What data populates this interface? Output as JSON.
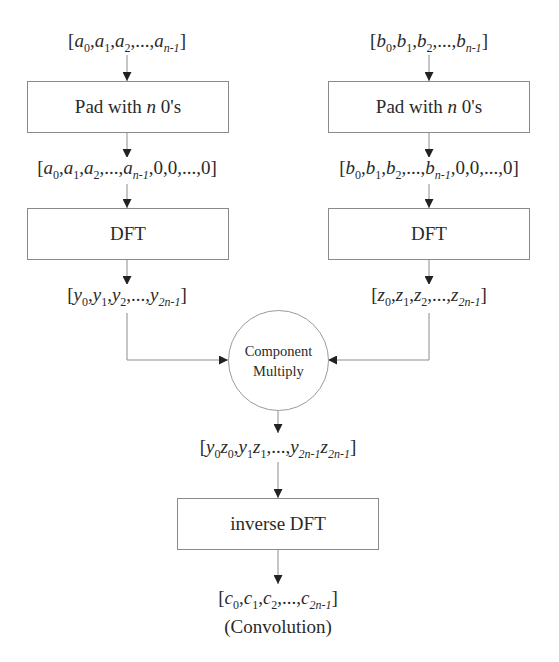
{
  "diagram": {
    "type": "flowchart",
    "left_branch": {
      "input": {
        "var": "a",
        "terms": [
          "0",
          "1",
          "2"
        ],
        "last": "n-1",
        "padding": ""
      },
      "pad_box": {
        "pre": "Pad with ",
        "var": "n",
        "post": " 0's"
      },
      "padded": {
        "var": "a",
        "terms": [
          "0",
          "1",
          "2"
        ],
        "last": "n-1",
        "padding": ",0,0,...,0"
      },
      "dft_box": {
        "label": "DFT"
      },
      "output": {
        "var": "y",
        "terms": [
          "0",
          "1",
          "2"
        ],
        "last": "2n-1",
        "padding": ""
      }
    },
    "right_branch": {
      "input": {
        "var": "b",
        "terms": [
          "0",
          "1",
          "2"
        ],
        "last": "n-1",
        "padding": ""
      },
      "pad_box": {
        "pre": "Pad with ",
        "var": "n",
        "post": " 0's"
      },
      "padded": {
        "var": "b",
        "terms": [
          "0",
          "1",
          "2"
        ],
        "last": "n-1",
        "padding": ",0,0,...,0"
      },
      "dft_box": {
        "label": "DFT"
      },
      "output": {
        "var": "z",
        "terms": [
          "0",
          "1",
          "2"
        ],
        "last": "2n-1",
        "padding": ""
      }
    },
    "combine": {
      "line1": "Component",
      "line2": "Multiply"
    },
    "product": {
      "display": "[y0z0,y1z1,...,y2n-1z2n-1]"
    },
    "inverse_box": {
      "label": "inverse DFT"
    },
    "result": {
      "var": "c",
      "terms": [
        "0",
        "1",
        "2"
      ],
      "last": "2n-1",
      "padding": ""
    },
    "result_caption": "(Convolution)",
    "text": {
      "open": "[",
      "close": "]",
      "comma": ",",
      "ellipsis": "...",
      "sub_2n1": "2n-1",
      "sub_0": "0",
      "sub_1": "1",
      "var_y": "y",
      "var_z": "z"
    }
  }
}
